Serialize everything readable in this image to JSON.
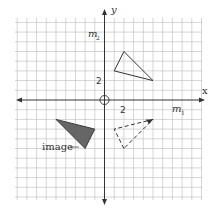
{
  "diagram": {
    "type": "coordinate-plane-transformations",
    "axes": {
      "x_label": "x",
      "y_label": "y",
      "x_tick_label": "2",
      "y_tick_label": "2"
    },
    "mirror_lines": {
      "m1": {
        "base": "m",
        "sub": "1"
      },
      "m2": {
        "base": "m",
        "sub": "2"
      }
    },
    "center_marker": "origin-circle",
    "figures": {
      "preimage": {
        "style": "solid-outline",
        "vertices": [
          [
            2,
            5
          ],
          [
            1,
            3
          ],
          [
            5,
            2
          ]
        ]
      },
      "reflection_m1": {
        "style": "dashed-outline",
        "vertices": [
          [
            2,
            -5
          ],
          [
            1,
            -3
          ],
          [
            5,
            -2
          ]
        ]
      },
      "image": {
        "style": "filled",
        "label": "image",
        "vertices": [
          [
            -2,
            -5
          ],
          [
            -1,
            -3
          ],
          [
            -5,
            -2
          ]
        ]
      }
    },
    "colors": {
      "grid": "#b8b8b8",
      "axis": "#333333",
      "fill": "#666666"
    }
  }
}
